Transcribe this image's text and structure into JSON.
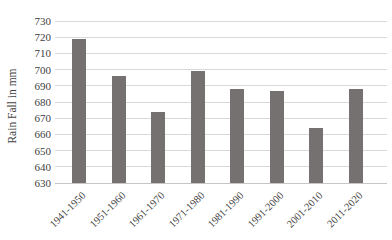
{
  "chart_data": {
    "type": "bar",
    "title": "",
    "xlabel": "",
    "ylabel": "Rain Fall in mm",
    "categories": [
      "1941-1950",
      "1951-1960",
      "1961-1970",
      "1971-1980",
      "1981-1990",
      "1991-2000",
      "2001-2010",
      "2011-2020"
    ],
    "values": [
      719,
      696,
      674,
      699,
      688,
      687,
      664,
      688
    ],
    "ylim": [
      630,
      730
    ],
    "ytick_step": 10,
    "yticks": [
      730,
      720,
      710,
      700,
      690,
      680,
      670,
      660,
      650,
      640,
      630
    ],
    "grid": "horizontal-major",
    "legend": "none",
    "colors": {
      "bar": "#767171",
      "gridline": "#d9d9d9",
      "axis_line": "#c6c6c6",
      "text": "#3f3f3f"
    }
  }
}
